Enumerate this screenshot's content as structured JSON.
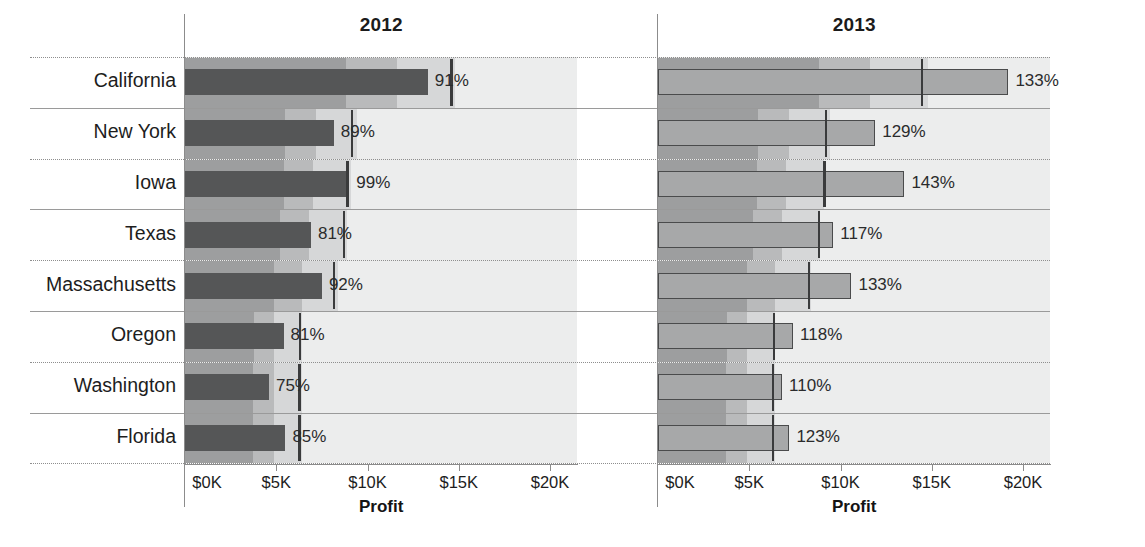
{
  "chart_data": {
    "type": "bar",
    "chart_kind": "bullet-chart-small-multiples",
    "title": "",
    "xlabel": "Profit",
    "ylabel": "",
    "xlim": [
      0,
      21500
    ],
    "xticks": [
      0,
      5000,
      10000,
      15000,
      20000
    ],
    "xticklabels": [
      "$0K",
      "$5K",
      "$10K",
      "$15K",
      "$20K"
    ],
    "grid": false,
    "legend": "none",
    "categories": [
      "California",
      "New York",
      "Iowa",
      "Texas",
      "Massachusetts",
      "Oregon",
      "Washington",
      "Florida"
    ],
    "panels": [
      {
        "label": "2012",
        "values": [
          13300,
          8150,
          9000,
          6900,
          7500,
          5400,
          4600,
          5500
        ],
        "targets": [
          14600,
          9150,
          8900,
          8700,
          8150,
          6300,
          6250,
          6250
        ],
        "data_labels": [
          "91%",
          "89%",
          "99%",
          "81%",
          "92%",
          "81%",
          "75%",
          "85%"
        ],
        "bands": [
          [
            8800,
            11600,
            14800
          ],
          [
            5500,
            7200,
            9400
          ],
          [
            5400,
            7000,
            9100
          ],
          [
            5200,
            6800,
            8900
          ],
          [
            4900,
            6400,
            8400
          ],
          [
            3800,
            4900,
            6400
          ],
          [
            3700,
            4900,
            6400
          ],
          [
            3700,
            4900,
            6400
          ]
        ]
      },
      {
        "label": "2013",
        "values": [
          19200,
          11900,
          13500,
          9600,
          10600,
          7400,
          6800,
          7200
        ],
        "targets": [
          14450,
          9200,
          9100,
          8800,
          8250,
          6350,
          6300,
          6300
        ],
        "data_labels": [
          "133%",
          "129%",
          "143%",
          "117%",
          "133%",
          "118%",
          "110%",
          "123%"
        ],
        "bands": [
          [
            8800,
            11600,
            14800
          ],
          [
            5500,
            7200,
            9400
          ],
          [
            5400,
            7000,
            9100
          ],
          [
            5200,
            6800,
            8900
          ],
          [
            4900,
            6400,
            8400
          ],
          [
            3800,
            4900,
            6400
          ],
          [
            3700,
            4900,
            6400
          ],
          [
            3700,
            4900,
            6400
          ]
        ]
      }
    ]
  },
  "colors": {
    "band_dark": "#9d9e9f",
    "band_mid": "#b9babb",
    "band_light": "#d6d7d8",
    "plot_bg": "#eceded",
    "measure_2012": "#555657",
    "measure_2013_fill": "#a7a8a9",
    "measure_2013_stroke": "#4a4b4c",
    "target": "#3a3b3c",
    "text": "#1d1d1d",
    "axis": "#8c8c8c"
  }
}
